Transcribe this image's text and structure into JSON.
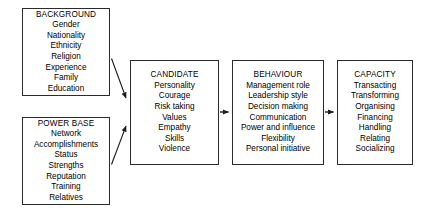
{
  "diagram": {
    "type": "flow-diagram",
    "background_color": "#ffffff",
    "line_color": "#2b2b2b",
    "boxes": [
      {
        "id": "background",
        "title": "BACKGROUND",
        "items": [
          "Gender",
          "Nationality",
          "Ethnicity",
          "Religion",
          "Experience",
          "Family",
          "Education"
        ]
      },
      {
        "id": "powerbase",
        "title": "POWER BASE",
        "items": [
          "Network",
          "Accomplishments",
          "Status",
          "Strengths",
          "Reputation",
          "Training",
          "Relatives"
        ]
      },
      {
        "id": "candidate",
        "title": "CANDIDATE",
        "items": [
          "Personality",
          "Courage",
          "Risk taking",
          "Values",
          "Empathy",
          "Skills",
          "Violence"
        ]
      },
      {
        "id": "behaviour",
        "title": "BEHAVIOUR",
        "items": [
          "Management role",
          "Leadership style",
          "Decision making",
          "Communication",
          "Power and influence",
          "Flexibility",
          "Personal initiative"
        ]
      },
      {
        "id": "capacity",
        "title": "CAPACITY",
        "items": [
          "Transacting",
          "Transforming",
          "Organising",
          "Financing",
          "Handling",
          "Relating",
          "Socializing"
        ]
      }
    ],
    "connectors": [
      {
        "id": "background-to-candidate",
        "from": "background",
        "to": "candidate",
        "style": "diagonal-arrow"
      },
      {
        "id": "powerbase-to-candidate",
        "from": "powerbase",
        "to": "candidate",
        "style": "diagonal-arrow"
      },
      {
        "id": "candidate-to-behaviour",
        "from": "candidate",
        "to": "behaviour",
        "style": "horizontal-arrow"
      },
      {
        "id": "behaviour-to-capacity",
        "from": "behaviour",
        "to": "capacity",
        "style": "horizontal-arrow"
      }
    ]
  }
}
